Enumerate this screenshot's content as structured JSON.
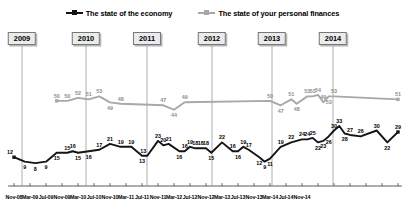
{
  "legend": {
    "items": [
      {
        "label": "The state of the economy",
        "color": "#141414",
        "marker": "line-square-marker"
      },
      {
        "label": "The state of your personal finances",
        "color": "#a8a8a8",
        "marker": "line-square-marker"
      }
    ]
  },
  "year_markers": [
    {
      "label": "2009",
      "x": 22
    },
    {
      "label": "2010",
      "x": 86
    },
    {
      "label": "2011",
      "x": 147
    },
    {
      "label": "2012",
      "x": 212
    },
    {
      "label": "2013",
      "x": 272
    },
    {
      "label": "2014",
      "x": 333
    }
  ],
  "chart_data": {
    "type": "line",
    "title": "",
    "xlabel": "",
    "ylabel": "",
    "grid": false,
    "legend_position": "top-center",
    "ylim": [
      0,
      60
    ],
    "x": [
      "Nov-08",
      "Dec-08",
      "Jan-09",
      "Feb-09",
      "Mar-09",
      "Apr-09",
      "May-09",
      "Jun-09",
      "Jul-09",
      "Aug-09",
      "Sep-09",
      "Oct-09",
      "Nov-09",
      "Dec-09",
      "Jan-10",
      "Feb-10",
      "Mar-10",
      "Apr-10",
      "May-10",
      "Jun-10",
      "Jul-10",
      "Aug-10",
      "Sep-10",
      "Oct-10",
      "Nov-10",
      "Dec-10",
      "Jan-11",
      "Feb-11",
      "Mar-11",
      "Apr-11",
      "May-11",
      "Jun-11",
      "Jul-11",
      "Aug-11",
      "Sep-11",
      "Oct-11",
      "Nov-11",
      "Dec-11",
      "Jan-12",
      "Feb-12",
      "Mar-12",
      "Apr-12",
      "May-12",
      "Jun-12",
      "Jul-12",
      "Aug-12",
      "Sep-12",
      "Oct-12",
      "Nov-12",
      "Dec-12",
      "Jan-13",
      "Feb-13",
      "Mar-13",
      "Apr-13",
      "May-13",
      "Jun-13",
      "Jul-13",
      "Aug-13",
      "Sep-13",
      "Oct-13",
      "Nov-13",
      "Dec-13",
      "Jan-14",
      "Feb-14",
      "Mar-14",
      "Apr-14",
      "May-14",
      "Jun-14",
      "Jul-14",
      "Aug-14",
      "Sep-14",
      "Oct-14",
      "Nov-14"
    ],
    "xtick_labels": [
      "Nov-08",
      "Mar-09",
      "Jul-09",
      "Nov-09",
      "Mar-10",
      "Jul-10",
      "Nov-10",
      "Mar-11",
      "Jul-11",
      "Nov-11",
      "Mar-12",
      "Jul-12",
      "Nov-12",
      "Mar-13",
      "Jul-13",
      "Nov-13",
      "Mar-14",
      "Jul-14",
      "Nov-14"
    ],
    "series": [
      {
        "name": "The state of the economy",
        "color": "#141414",
        "points": [
          {
            "x": "Nov-08",
            "y": 12,
            "label": "12",
            "pos": "left"
          },
          {
            "x": "Jan-09",
            "y": 9,
            "label": "9",
            "pos": "below"
          },
          {
            "x": "Mar-09",
            "y": 8,
            "label": "8",
            "pos": "below"
          },
          {
            "x": "May-09",
            "y": 9,
            "label": "9",
            "pos": "below"
          },
          {
            "x": "Jul-09",
            "y": 15,
            "label": "15",
            "pos": "below"
          },
          {
            "x": "Sep-09",
            "y": 15,
            "label": "15",
            "pos": "above"
          },
          {
            "x": "Oct-09",
            "y": 16,
            "label": "16",
            "pos": "above"
          },
          {
            "x": "Nov-09",
            "y": 15,
            "label": "15",
            "pos": "below"
          },
          {
            "x": "Jan-10",
            "y": 16,
            "label": "16",
            "pos": "below"
          },
          {
            "x": "Mar-10",
            "y": 17,
            "label": "17",
            "pos": "above"
          },
          {
            "x": "May-10",
            "y": 21,
            "label": "21",
            "pos": "above"
          },
          {
            "x": "Jul-10",
            "y": 19,
            "label": "19",
            "pos": "above"
          },
          {
            "x": "Sep-10",
            "y": 19,
            "label": "19",
            "pos": "above"
          },
          {
            "x": "Nov-10",
            "y": 13,
            "label": "13",
            "pos": "below"
          },
          {
            "x": "Dec-10",
            "y": 13,
            "label": "13",
            "pos": "left"
          },
          {
            "x": "Feb-11",
            "y": 23,
            "label": "23",
            "pos": "above"
          },
          {
            "x": "Mar-11",
            "y": 20,
            "label": "20",
            "pos": "above"
          },
          {
            "x": "Apr-11",
            "y": 21,
            "label": "21",
            "pos": "above"
          },
          {
            "x": "Jun-11",
            "y": 16,
            "label": "16",
            "pos": "below"
          },
          {
            "x": "Jul-11",
            "y": 16,
            "label": "16",
            "pos": "above"
          },
          {
            "x": "Aug-11",
            "y": 19,
            "label": "19",
            "pos": "above"
          },
          {
            "x": "Sep-11",
            "y": 18,
            "label": "18",
            "pos": "above"
          },
          {
            "x": "Oct-11",
            "y": 18,
            "label": "18",
            "pos": "above"
          },
          {
            "x": "Nov-11",
            "y": 18,
            "label": "18",
            "pos": "above"
          },
          {
            "x": "Dec-11",
            "y": 15,
            "label": "15",
            "pos": "below"
          },
          {
            "x": "Feb-12",
            "y": 22,
            "label": "22",
            "pos": "above"
          },
          {
            "x": "Apr-12",
            "y": 16,
            "label": "16",
            "pos": "above"
          },
          {
            "x": "May-12",
            "y": 16,
            "label": "16",
            "pos": "below"
          },
          {
            "x": "Jun-12",
            "y": 19,
            "label": "19",
            "pos": "above"
          },
          {
            "x": "Jul-12",
            "y": 17,
            "label": "17",
            "pos": "above"
          },
          {
            "x": "Sep-12",
            "y": 12,
            "label": "12",
            "pos": "below"
          },
          {
            "x": "Oct-12",
            "y": 9,
            "label": "9",
            "pos": "below"
          },
          {
            "x": "Nov-12",
            "y": 11,
            "label": "11",
            "pos": "below"
          },
          {
            "x": "Jan-13",
            "y": 19,
            "label": "19",
            "pos": "above"
          },
          {
            "x": "Mar-13",
            "y": 22,
            "label": "22",
            "pos": "above"
          },
          {
            "x": "May-13",
            "y": 24,
            "label": "24",
            "pos": "above"
          },
          {
            "x": "Jun-13",
            "y": 24,
            "label": "24",
            "pos": "above"
          },
          {
            "x": "Jul-13",
            "y": 25,
            "label": "25",
            "pos": "above"
          },
          {
            "x": "Aug-13",
            "y": 22,
            "label": "22",
            "pos": "below"
          },
          {
            "x": "Sep-13",
            "y": 23,
            "label": "23",
            "pos": "below"
          },
          {
            "x": "Oct-13",
            "y": 26,
            "label": "26",
            "pos": "below"
          },
          {
            "x": "Nov-13",
            "y": 30,
            "label": "30",
            "pos": "above"
          },
          {
            "x": "Dec-13",
            "y": 33,
            "label": "33",
            "pos": "above"
          },
          {
            "x": "Jan-14",
            "y": 28,
            "label": "28",
            "pos": "below"
          },
          {
            "x": "Feb-14",
            "y": 27,
            "label": "27",
            "pos": "above"
          },
          {
            "x": "Apr-14",
            "y": 26,
            "label": "26",
            "pos": "above"
          },
          {
            "x": "Jul-14",
            "y": 30,
            "label": "30",
            "pos": "above"
          },
          {
            "x": "Sep-14",
            "y": 22,
            "label": "22",
            "pos": "below"
          },
          {
            "x": "Nov-14",
            "y": 29,
            "label": "29",
            "pos": "above"
          }
        ]
      },
      {
        "name": "The state of your personal finances",
        "color": "#a8a8a8",
        "points": [
          {
            "x": "Jul-09",
            "y": 50,
            "label": "50",
            "pos": "above"
          },
          {
            "x": "Sep-09",
            "y": 50,
            "label": "50",
            "pos": "above"
          },
          {
            "x": "Nov-09",
            "y": 52,
            "label": "52",
            "pos": "above"
          },
          {
            "x": "Jan-10",
            "y": 51,
            "label": "51",
            "pos": "above"
          },
          {
            "x": "Mar-10",
            "y": 53,
            "label": "53",
            "pos": "above"
          },
          {
            "x": "May-10",
            "y": 49,
            "label": "49",
            "pos": "below"
          },
          {
            "x": "Jul-10",
            "y": 48,
            "label": "48",
            "pos": "above"
          },
          {
            "x": "Mar-11",
            "y": 47,
            "label": "47",
            "pos": "above"
          },
          {
            "x": "May-11",
            "y": 44,
            "label": "44",
            "pos": "below"
          },
          {
            "x": "Jul-11",
            "y": 49,
            "label": "49",
            "pos": "above"
          },
          {
            "x": "Nov-12",
            "y": 50,
            "label": "50",
            "pos": "above"
          },
          {
            "x": "Jan-13",
            "y": 47,
            "label": "47",
            "pos": "below"
          },
          {
            "x": "Mar-13",
            "y": 51,
            "label": "51",
            "pos": "above"
          },
          {
            "x": "Apr-13",
            "y": 48,
            "label": "48",
            "pos": "below"
          },
          {
            "x": "Jun-13",
            "y": 53,
            "label": "53",
            "pos": "above"
          },
          {
            "x": "Jul-13",
            "y": 53,
            "label": "53",
            "pos": "above"
          },
          {
            "x": "Aug-13",
            "y": 54,
            "label": "54",
            "pos": "above"
          },
          {
            "x": "Sep-13",
            "y": 49,
            "label": "49",
            "pos": "above"
          },
          {
            "x": "Oct-13",
            "y": 53,
            "label": "53",
            "pos": "below"
          },
          {
            "x": "Nov-13",
            "y": 53,
            "label": "53",
            "pos": "above"
          },
          {
            "x": "Nov-14",
            "y": 51,
            "label": "51",
            "pos": "above"
          }
        ]
      }
    ]
  }
}
